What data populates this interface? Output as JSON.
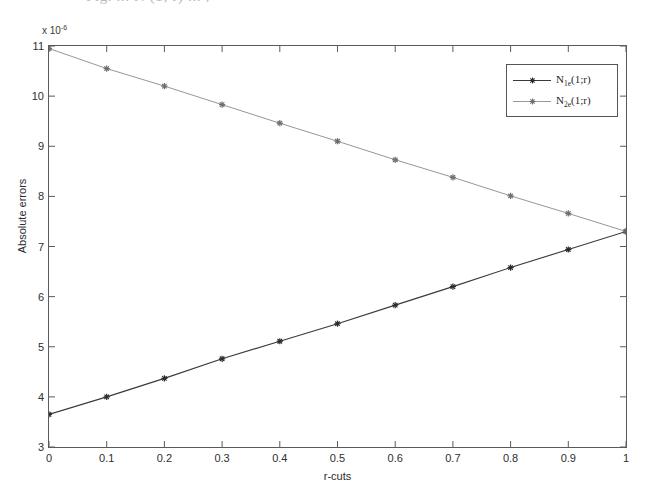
{
  "figure": {
    "cut_off_caption": "Fig. ...  N   (1; r)   ...   ,",
    "background_color": "#ffffff",
    "frame_color": "#5a5a5a"
  },
  "chart_data": {
    "type": "line",
    "title": "",
    "subtitle": "",
    "xlabel": "r-cuts",
    "ylabel": "Absolute errors",
    "y_multiplier_text": "x 10",
    "y_multiplier_exponent": "-6",
    "y_multiplier_value": 1e-06,
    "xlim": [
      0,
      1
    ],
    "ylim": [
      3,
      11
    ],
    "xticks": [
      "0",
      "0.1",
      "0.2",
      "0.3",
      "0.4",
      "0.5",
      "0.6",
      "0.7",
      "0.8",
      "0.9",
      "1"
    ],
    "xtick_values": [
      0,
      0.1,
      0.2,
      0.3,
      0.4,
      0.5,
      0.6,
      0.7,
      0.8,
      0.9,
      1
    ],
    "yticks": [
      "3",
      "4",
      "5",
      "6",
      "7",
      "8",
      "9",
      "10",
      "11"
    ],
    "ytick_values": [
      3,
      4,
      5,
      6,
      7,
      8,
      9,
      10,
      11
    ],
    "grid": false,
    "legend_position": "top-right",
    "x": [
      0,
      0.1,
      0.2,
      0.3,
      0.4,
      0.5,
      0.6,
      0.7,
      0.8,
      0.9,
      1
    ],
    "series": [
      {
        "name": "N_1e(1;r)",
        "label_base": "N",
        "label_sub": "1e",
        "label_tail": "(1;r)",
        "color": "#3a3a3a",
        "marker": "star",
        "values": [
          3.65,
          4.0,
          4.37,
          4.76,
          5.11,
          5.46,
          5.83,
          6.2,
          6.58,
          6.94,
          7.3
        ]
      },
      {
        "name": "N_2e(1;r)",
        "label_base": "N",
        "label_sub": "2e",
        "label_tail": "(1;r)",
        "color": "#8a8a8a",
        "marker": "star",
        "values": [
          10.95,
          10.55,
          10.2,
          9.83,
          9.46,
          9.1,
          8.73,
          8.38,
          8.01,
          7.66,
          7.3
        ]
      }
    ]
  }
}
